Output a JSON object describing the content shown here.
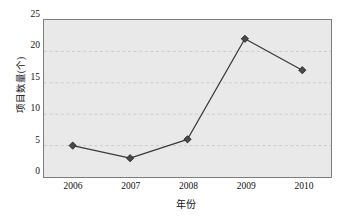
{
  "chart_data": {
    "type": "line",
    "title": "",
    "subtitle": "",
    "xlabel": "年份",
    "ylabel": "项目数量(个)",
    "categories": [
      "2006",
      "2007",
      "2008",
      "2009",
      "2010"
    ],
    "values": [
      5,
      3,
      6,
      22,
      17
    ],
    "series": [
      {
        "name": "项目数量(个)",
        "values": [
          5,
          3,
          6,
          22,
          17
        ]
      }
    ],
    "points": [
      {
        "x": "2006",
        "y": 5
      },
      {
        "x": "2007",
        "y": 3
      },
      {
        "x": "2008",
        "y": 6
      },
      {
        "x": "2009",
        "y": 22
      },
      {
        "x": "2010",
        "y": 17
      }
    ],
    "ylim": [
      0,
      25
    ],
    "ytick_labels": [
      "0",
      "5",
      "10",
      "15",
      "20",
      "25"
    ],
    "ytick_values": [
      0,
      5,
      10,
      15,
      20,
      25
    ],
    "xtick_labels": [
      "2006",
      "2007",
      "2008",
      "2009",
      "2010"
    ],
    "grid": "horizontal-dashed",
    "legend": "none",
    "legend_position": "",
    "annotations": [],
    "colors": {
      "plot_background": "#e9e9e9",
      "plot_border": "#7d7d7d",
      "gridline": "#cfcfcf",
      "line": "#3b3b3b",
      "marker_fill": "#4a4a4a",
      "marker_edge": "#2b2b2b",
      "text": "#111111",
      "page_background": "#ffffff"
    },
    "marker_shape": "diamond"
  }
}
